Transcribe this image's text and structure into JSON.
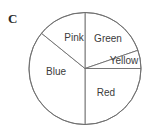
{
  "figure": {
    "panel_label": "C",
    "background_color": "#ffffff",
    "stroke_color": "#6d6d6d",
    "text_color": "#3b3b3b"
  },
  "chart_data": {
    "type": "pie",
    "title": "C",
    "xlabel": "",
    "ylabel": "",
    "legend": "none",
    "grid": false,
    "labels_inside": true,
    "center": [
      85,
      68.5
    ],
    "radius": 56,
    "categories": [
      "Green",
      "Yellow",
      "Red",
      "Blue",
      "Pink"
    ],
    "values": [
      71,
      19,
      90,
      130,
      50
    ],
    "unit": "degrees",
    "slices": [
      {
        "name": "Green",
        "label": "Green",
        "start_angle": 19,
        "end_angle": 90,
        "sweep": 71,
        "fill": "#ffffff",
        "label_x": 108,
        "label_y": 39
      },
      {
        "name": "Yellow",
        "label": "Yellow",
        "start_angle": 0,
        "end_angle": 19,
        "sweep": 19,
        "fill": "#ffffff",
        "label_x": 124,
        "label_y": 61
      },
      {
        "name": "Red",
        "label": "Red",
        "start_angle": 270,
        "end_angle": 360,
        "sweep": 90,
        "fill": "#ffffff",
        "label_x": 106,
        "label_y": 93
      },
      {
        "name": "Blue",
        "label": "Blue",
        "start_angle": 141,
        "end_angle": 270,
        "sweep": 129,
        "fill": "#ffffff",
        "label_x": 56,
        "label_y": 72
      },
      {
        "name": "Pink",
        "label": "Pink",
        "start_angle": 90,
        "end_angle": 141,
        "sweep": 51,
        "fill": "#ffffff",
        "label_x": 74,
        "label_y": 38
      }
    ]
  }
}
